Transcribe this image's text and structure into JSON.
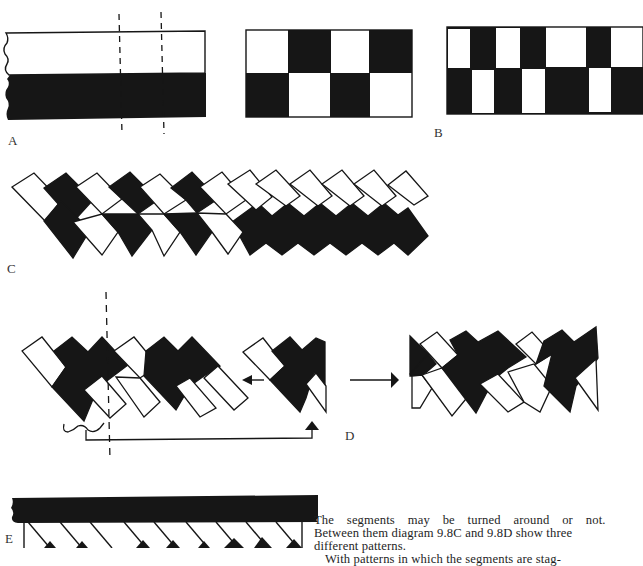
{
  "page": {
    "ink_color": "#161616",
    "paper_color": "#ffffff"
  },
  "labels": {
    "A": "A",
    "B": "B",
    "C": "C",
    "D": "D",
    "E": "E"
  },
  "figures": {
    "A": {
      "description": "Flat band, white upper half, black lower half, two dashed cut lines",
      "top_color": "white",
      "bottom_color": "black",
      "dashed_lines": 2
    },
    "B": {
      "panels": [
        {
          "name": "regular-checker",
          "columns": 4,
          "rows": [
            [
              "white",
              "black",
              "white",
              "black"
            ],
            [
              "black",
              "white",
              "black",
              "white"
            ]
          ]
        },
        {
          "name": "irregular-checker",
          "columns": 7,
          "rows": [
            [
              "white",
              "black",
              "white",
              "black",
              "white",
              "black",
              "white"
            ],
            [
              "black",
              "white",
              "black",
              "white",
              "black",
              "white",
              "black"
            ]
          ]
        }
      ]
    },
    "C": {
      "description": "Diagonal segments forming chevron pattern; left part alternating, right part white-over-black zigzag",
      "segments": 12
    },
    "D": {
      "description": "Segment sequence with dashed dividing line, segment moved from right end to left, resulting pattern",
      "arrows": [
        "left-arrow",
        "up-arrow",
        "right-arrow"
      ]
    },
    "E": {
      "description": "Black band with diagonal segments hanging beneath"
    }
  },
  "text": {
    "lines": [
      "The segments may be turned around or not.",
      "Between them diagram 9.8C and 9.8D show three",
      "different patterns.",
      "With patterns in which the segments are stag-"
    ]
  }
}
